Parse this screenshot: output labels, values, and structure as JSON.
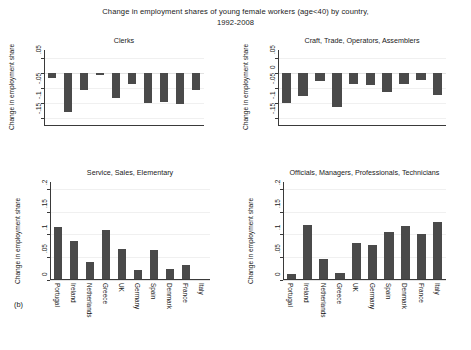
{
  "figure": {
    "title_line1": "Change in employment shares of young female workers (age<40) by country,",
    "title_line2": "1992-2008",
    "panel_letter": "(b)",
    "bar_color": "#4a4a4a",
    "axis_color": "#3a3a3a",
    "grid_color": "#f0f0f0"
  },
  "axis_titles": {
    "y": "Change in employment share"
  },
  "chart_data": [
    {
      "type": "bar",
      "id": "clerks",
      "title": "Clerks",
      "xlabel": "",
      "ylabel": "Change in employment share",
      "categories": [
        "Portugal",
        "Ireland",
        "Netherlands",
        "Greece",
        "UK",
        "Germany",
        "Spain",
        "Denmark",
        "France",
        "Italy"
      ],
      "values": [
        -0.018,
        -0.128,
        -0.055,
        -0.008,
        -0.083,
        -0.038,
        -0.099,
        -0.096,
        -0.101,
        -0.055
      ],
      "ylim": [
        -0.175,
        0.075
      ],
      "yticks": [
        0.05,
        0,
        -0.05,
        -0.1,
        -0.15
      ],
      "yticklabels": [
        ".05",
        "0",
        "-.05",
        "-.1",
        "-.15"
      ],
      "ytick_shown": [
        ".05",
        "-.05",
        "-.1",
        "-.15"
      ],
      "grid": true,
      "legend": "none"
    },
    {
      "type": "bar",
      "id": "craft",
      "title": "Craft, Trade, Operators, Assemblers",
      "xlabel": "",
      "ylabel": "Change in employment share",
      "categories": [
        "Portugal",
        "Ireland",
        "Netherlands",
        "Greece",
        "UK",
        "Germany",
        "Spain",
        "Denmark",
        "France",
        "Italy"
      ],
      "values": [
        -0.1,
        -0.077,
        -0.026,
        -0.113,
        -0.037,
        -0.04,
        -0.064,
        -0.038,
        -0.023,
        -0.072
      ],
      "ylim": [
        -0.175,
        0.075
      ],
      "yticks": [
        0.05,
        0,
        -0.05,
        -0.1,
        -0.15
      ],
      "yticklabels": [
        ".05",
        "0",
        "-.05",
        "-.1",
        "-.15"
      ],
      "ytick_shown": [
        ".05",
        "0",
        "-.05",
        "-.1",
        "-.15"
      ],
      "grid": true,
      "legend": "none"
    },
    {
      "type": "bar",
      "id": "service",
      "title": "Service, Sales, Elementary",
      "xlabel": "",
      "ylabel": "Change in employment share",
      "categories": [
        "Portugal",
        "Ireland",
        "Netherlands",
        "Greece",
        "UK",
        "Germany",
        "Spain",
        "Denmark",
        "France",
        "Italy"
      ],
      "values": [
        0.116,
        0.086,
        0.039,
        0.109,
        0.068,
        0.022,
        0.065,
        0.024,
        0.034,
        0.002
      ],
      "ylim": [
        0,
        0.215
      ],
      "yticks": [
        0,
        0.05,
        0.1,
        0.15,
        0.2
      ],
      "yticklabels": [
        "0",
        ".05",
        ".1",
        ".15",
        ".2"
      ],
      "ytick_shown": [
        "0",
        ".05",
        ".1",
        ".15",
        ".2"
      ],
      "grid": true,
      "legend": "none"
    },
    {
      "type": "bar",
      "id": "officials",
      "title": "Officials, Managers, Professionals, Technicians",
      "xlabel": "",
      "ylabel": "Change in employment share",
      "categories": [
        "Portugal",
        "Ireland",
        "Netherlands",
        "Greece",
        "UK",
        "Germany",
        "Spain",
        "Denmark",
        "France",
        "Italy"
      ],
      "values": [
        0.013,
        0.121,
        0.046,
        0.016,
        0.081,
        0.076,
        0.106,
        0.118,
        0.102,
        0.128
      ],
      "ylim": [
        0,
        0.215
      ],
      "yticks": [
        0,
        0.05,
        0.1,
        0.15,
        0.2
      ],
      "yticklabels": [
        "0",
        ".05",
        ".1",
        ".15",
        ".2"
      ],
      "ytick_shown": [
        "0",
        ".05",
        ".1",
        ".15",
        ".2"
      ],
      "grid": true,
      "legend": "none"
    }
  ]
}
